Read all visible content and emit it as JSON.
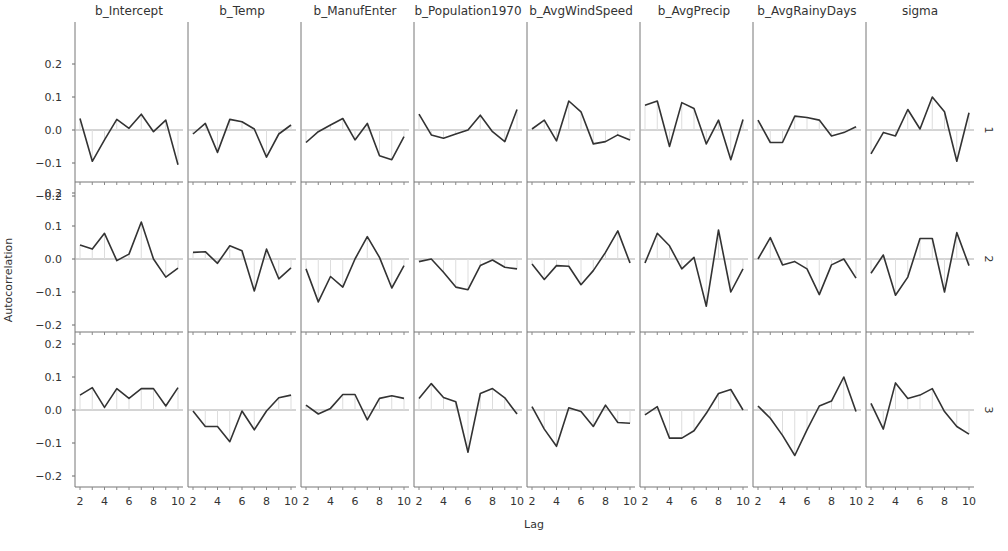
{
  "chart_data": {
    "type": "line",
    "title": "",
    "xlabel": "Lag",
    "ylabel": "Autocorrelation",
    "ylim": [
      -0.22,
      0.22
    ],
    "yticks": [
      0.2,
      0.1,
      0.0,
      -0.1,
      -0.2
    ],
    "ytick_labels": [
      "0.2",
      "0.1",
      "0.0",
      "-0.1",
      "-0.2"
    ],
    "xticks": [
      2,
      4,
      6,
      8,
      10
    ],
    "xtick_labels": [
      "2",
      "4",
      "6",
      "8",
      "10"
    ],
    "x": [
      2,
      3,
      4,
      5,
      6,
      7,
      8,
      9,
      10
    ],
    "columns": [
      "b_Intercept",
      "b_Temp",
      "b_ManufEnter",
      "b_Population1970",
      "b_AvgWindSpeed",
      "b_AvgPrecip",
      "b_AvgRainyDays",
      "sigma"
    ],
    "rows": [
      "1",
      "2",
      "3"
    ],
    "grid": false,
    "reference_line": 0.0,
    "line_color": "#333333",
    "zero_line_color": "#aaaaaa",
    "series": [
      {
        "row": "1",
        "column": "b_Intercept",
        "values": [
          0.035,
          -0.095,
          -0.03,
          0.032,
          0.005,
          0.048,
          -0.005,
          0.03,
          -0.105
        ]
      },
      {
        "row": "1",
        "column": "b_Temp",
        "values": [
          -0.012,
          0.02,
          -0.068,
          0.032,
          0.025,
          0.003,
          -0.082,
          -0.012,
          0.015
        ]
      },
      {
        "row": "1",
        "column": "b_ManufEnter",
        "values": [
          -0.038,
          -0.005,
          0.015,
          0.035,
          -0.03,
          0.02,
          -0.078,
          -0.09,
          -0.02
        ]
      },
      {
        "row": "1",
        "column": "b_Population1970",
        "values": [
          0.048,
          -0.015,
          -0.025,
          -0.012,
          0.0,
          0.045,
          -0.005,
          -0.035,
          0.062
        ]
      },
      {
        "row": "1",
        "column": "b_AvgWindSpeed",
        "values": [
          0.003,
          0.03,
          -0.033,
          0.088,
          0.055,
          -0.042,
          -0.035,
          -0.015,
          -0.03
        ]
      },
      {
        "row": "1",
        "column": "b_AvgPrecip",
        "values": [
          0.075,
          0.088,
          -0.05,
          0.083,
          0.065,
          -0.042,
          0.03,
          -0.09,
          0.032
        ]
      },
      {
        "row": "1",
        "column": "b_AvgRainyDays",
        "values": [
          0.03,
          -0.038,
          -0.038,
          0.042,
          0.038,
          0.03,
          -0.018,
          -0.008,
          0.01
        ]
      },
      {
        "row": "1",
        "column": "sigma",
        "values": [
          -0.072,
          -0.008,
          -0.018,
          0.062,
          0.003,
          0.1,
          0.055,
          -0.095,
          0.052
        ]
      },
      {
        "row": "2",
        "column": "b_Intercept",
        "values": [
          0.042,
          0.03,
          0.078,
          -0.005,
          0.015,
          0.112,
          0.0,
          -0.055,
          -0.028
        ]
      },
      {
        "row": "2",
        "column": "b_Temp",
        "values": [
          0.02,
          0.022,
          -0.013,
          0.04,
          0.025,
          -0.097,
          0.03,
          -0.06,
          -0.027
        ]
      },
      {
        "row": "2",
        "column": "b_ManufEnter",
        "values": [
          -0.03,
          -0.13,
          -0.053,
          -0.085,
          0.0,
          0.068,
          0.005,
          -0.088,
          -0.02
        ]
      },
      {
        "row": "2",
        "column": "b_Population1970",
        "values": [
          -0.008,
          0.0,
          -0.04,
          -0.085,
          -0.093,
          -0.02,
          -0.003,
          -0.025,
          -0.03
        ]
      },
      {
        "row": "2",
        "column": "b_AvgWindSpeed",
        "values": [
          -0.015,
          -0.062,
          -0.02,
          -0.022,
          -0.078,
          -0.035,
          0.02,
          0.085,
          -0.012
        ]
      },
      {
        "row": "2",
        "column": "b_AvgPrecip",
        "values": [
          -0.012,
          0.078,
          0.04,
          -0.03,
          0.005,
          -0.143,
          0.088,
          -0.1,
          -0.03
        ]
      },
      {
        "row": "2",
        "column": "b_AvgRainyDays",
        "values": [
          0.0,
          0.065,
          -0.018,
          -0.008,
          -0.03,
          -0.108,
          -0.018,
          0.0,
          -0.058
        ]
      },
      {
        "row": "2",
        "column": "sigma",
        "values": [
          -0.043,
          0.012,
          -0.11,
          -0.055,
          0.062,
          0.062,
          -0.1,
          0.08,
          -0.02
        ]
      },
      {
        "row": "3",
        "column": "b_Intercept",
        "values": [
          0.045,
          0.068,
          0.008,
          0.065,
          0.035,
          0.065,
          0.065,
          0.012,
          0.068
        ]
      },
      {
        "row": "3",
        "column": "b_Temp",
        "values": [
          -0.003,
          -0.05,
          -0.05,
          -0.096,
          -0.003,
          -0.06,
          -0.003,
          0.037,
          0.045
        ]
      },
      {
        "row": "3",
        "column": "b_ManufEnter",
        "values": [
          0.015,
          -0.012,
          0.005,
          0.047,
          0.047,
          -0.03,
          0.035,
          0.043,
          0.035
        ]
      },
      {
        "row": "3",
        "column": "b_Population1970",
        "values": [
          0.035,
          0.08,
          0.038,
          0.025,
          -0.128,
          0.05,
          0.065,
          0.037,
          -0.012
        ]
      },
      {
        "row": "3",
        "column": "b_AvgWindSpeed",
        "values": [
          0.01,
          -0.058,
          -0.11,
          0.007,
          -0.005,
          -0.05,
          0.015,
          -0.038,
          -0.04
        ]
      },
      {
        "row": "3",
        "column": "b_AvgPrecip",
        "values": [
          -0.015,
          0.01,
          -0.085,
          -0.085,
          -0.063,
          -0.01,
          0.05,
          0.062,
          0.0
        ]
      },
      {
        "row": "3",
        "column": "b_AvgRainyDays",
        "values": [
          0.012,
          -0.025,
          -0.077,
          -0.138,
          -0.06,
          0.012,
          0.027,
          0.1,
          -0.005
        ]
      },
      {
        "row": "3",
        "column": "sigma",
        "values": [
          0.02,
          -0.058,
          0.082,
          0.035,
          0.045,
          0.065,
          -0.005,
          -0.05,
          -0.073
        ]
      }
    ]
  }
}
